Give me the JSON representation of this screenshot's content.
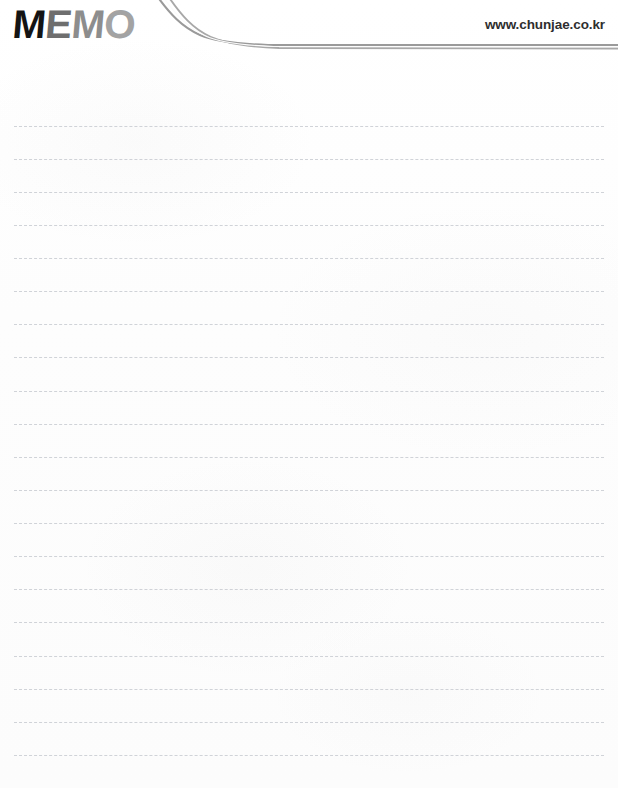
{
  "page": {
    "width": 618,
    "height": 788,
    "background_color": "#fdfdfd",
    "type": "memo-notepad-page"
  },
  "header": {
    "logo": {
      "text": "MEMO",
      "letters": [
        {
          "char": "M",
          "color": "#141414"
        },
        {
          "char": "E",
          "color": "#6e6e6e"
        },
        {
          "char": "M",
          "color": "#8d8d8d"
        },
        {
          "char": "O",
          "color": "#a3a3a3"
        }
      ]
    },
    "url": "www.chunjae.co.kr",
    "url_color": "#2e2e2e",
    "swoosh": {
      "stroke_color": "#9a9a9a",
      "stroke_color_light": "#c4c4c4",
      "description": "double curved rule sweeping from top-left down to horizontal right edge"
    }
  },
  "notes": {
    "line_color": "#c9ccd2",
    "line_style": "dashed",
    "line_left": 14,
    "line_right": 604,
    "line_count": 20,
    "line_spacing": 33.1,
    "first_line_y": 126,
    "lines": [
      {
        "index": 1,
        "y": 126,
        "text": ""
      },
      {
        "index": 2,
        "y": 159,
        "text": ""
      },
      {
        "index": 3,
        "y": 192,
        "text": ""
      },
      {
        "index": 4,
        "y": 225,
        "text": ""
      },
      {
        "index": 5,
        "y": 258,
        "text": ""
      },
      {
        "index": 6,
        "y": 291,
        "text": ""
      },
      {
        "index": 7,
        "y": 324,
        "text": ""
      },
      {
        "index": 8,
        "y": 357,
        "text": ""
      },
      {
        "index": 9,
        "y": 391,
        "text": ""
      },
      {
        "index": 10,
        "y": 424,
        "text": ""
      },
      {
        "index": 11,
        "y": 457,
        "text": ""
      },
      {
        "index": 12,
        "y": 490,
        "text": ""
      },
      {
        "index": 13,
        "y": 523,
        "text": ""
      },
      {
        "index": 14,
        "y": 556,
        "text": ""
      },
      {
        "index": 15,
        "y": 589,
        "text": ""
      },
      {
        "index": 16,
        "y": 622,
        "text": ""
      },
      {
        "index": 17,
        "y": 656,
        "text": ""
      },
      {
        "index": 18,
        "y": 689,
        "text": ""
      },
      {
        "index": 19,
        "y": 722,
        "text": ""
      },
      {
        "index": 20,
        "y": 755,
        "text": ""
      }
    ]
  }
}
